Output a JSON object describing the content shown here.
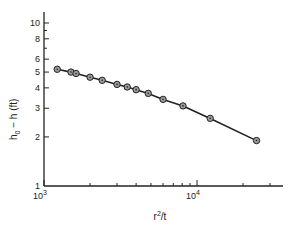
{
  "chart_data": {
    "type": "line",
    "title": "",
    "xlabel": "r²/t",
    "ylabel": "h₀ − h (ft)",
    "xscale": "log",
    "yscale": "log",
    "xlim": [
      1000,
      30000
    ],
    "ylim": [
      1,
      12
    ],
    "grid": false,
    "legend": null,
    "x_tick_labels": [
      {
        "value": 1000,
        "label": "10",
        "sup": "3"
      },
      {
        "value": 10000,
        "label": "10",
        "sup": "4"
      }
    ],
    "x_minor_ticks": [
      2000,
      3000,
      4000,
      5000,
      6000,
      7000,
      8000,
      9000,
      20000,
      30000
    ],
    "y_tick_labels": [
      1,
      2,
      3,
      4,
      5,
      6,
      8,
      10
    ],
    "y_minor_ticks": [
      7,
      9
    ],
    "series": [
      {
        "name": "drawdown",
        "marker": "circle-dot",
        "x": [
          1220,
          1500,
          1620,
          2000,
          2400,
          3000,
          3500,
          4000,
          4800,
          6000,
          8100,
          12200,
          24500
        ],
        "y": [
          5.2,
          5.0,
          4.9,
          4.65,
          4.45,
          4.2,
          4.05,
          3.9,
          3.7,
          3.4,
          3.1,
          2.6,
          1.9
        ]
      }
    ]
  },
  "labels": {
    "y_title_main": "h",
    "y_title_sub": "0",
    "y_title_rest": " − h (ft)",
    "x_title_base": "r",
    "x_title_sup": "2",
    "x_title_rest": "/t"
  }
}
